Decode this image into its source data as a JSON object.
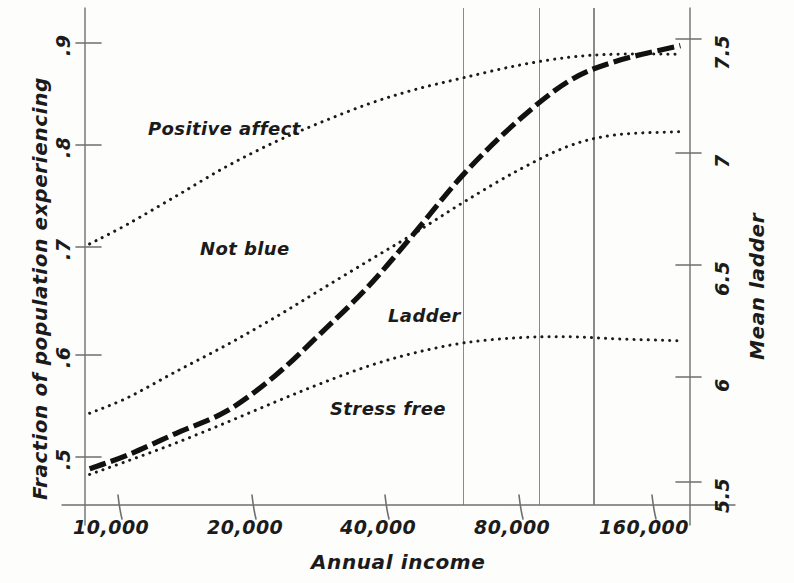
{
  "chart_data": {
    "type": "line",
    "title": "",
    "xlabel": "Annual income",
    "ylabel_left": "Fraction of population experiencing",
    "ylabel_right": "Mean ladder",
    "x_scale": "log",
    "x_tick_labels": [
      "10,000",
      "20,000",
      "40,000",
      "80,000",
      "160,000"
    ],
    "x_tick_values": [
      10000,
      20000,
      40000,
      80000,
      160000
    ],
    "xlim": [
      8000,
      200000
    ],
    "y_left_tick_labels": [
      ".9",
      ".8",
      ".7",
      ".6",
      ".5"
    ],
    "y_left_tick_values": [
      0.9,
      0.8,
      0.7,
      0.6,
      0.5
    ],
    "ylim_left": [
      0.455,
      0.942
    ],
    "y_right_tick_labels": [
      "7.5",
      "7",
      "6.5",
      "6",
      "5.5"
    ],
    "y_right_tick_values": [
      7.5,
      7.0,
      6.5,
      6.0,
      5.5
    ],
    "ylim_right": [
      5.39,
      7.66
    ],
    "grid": "vertical gridlines only",
    "gridline_x_values": [
      60000,
      90000,
      120000
    ],
    "legend": "inline labels next to each curve",
    "series": [
      {
        "name": "Positive affect",
        "axis": "left",
        "style": "dotted",
        "label_position": {
          "x": 148,
          "y": 118
        },
        "points": [
          {
            "income": 8200,
            "value": 0.703
          },
          {
            "income": 10000,
            "value": 0.722
          },
          {
            "income": 13000,
            "value": 0.75
          },
          {
            "income": 17000,
            "value": 0.779
          },
          {
            "income": 22000,
            "value": 0.803
          },
          {
            "income": 28000,
            "value": 0.822
          },
          {
            "income": 36000,
            "value": 0.84
          },
          {
            "income": 46000,
            "value": 0.854
          },
          {
            "income": 60000,
            "value": 0.866
          },
          {
            "income": 80000,
            "value": 0.878
          },
          {
            "income": 105000,
            "value": 0.886
          },
          {
            "income": 135000,
            "value": 0.889
          },
          {
            "income": 190000,
            "value": 0.889
          }
        ]
      },
      {
        "name": "Not blue",
        "axis": "left",
        "style": "dotted",
        "label_position": {
          "x": 200,
          "y": 238
        },
        "points": [
          {
            "income": 8200,
            "value": 0.537
          },
          {
            "income": 10000,
            "value": 0.552
          },
          {
            "income": 13000,
            "value": 0.578
          },
          {
            "income": 17000,
            "value": 0.604
          },
          {
            "income": 22000,
            "value": 0.631
          },
          {
            "income": 28000,
            "value": 0.658
          },
          {
            "income": 36000,
            "value": 0.686
          },
          {
            "income": 46000,
            "value": 0.713
          },
          {
            "income": 60000,
            "value": 0.744
          },
          {
            "income": 80000,
            "value": 0.775
          },
          {
            "income": 105000,
            "value": 0.799
          },
          {
            "income": 135000,
            "value": 0.81
          },
          {
            "income": 190000,
            "value": 0.813
          }
        ]
      },
      {
        "name": "Ladder",
        "axis": "right",
        "style": "thick-dashed",
        "label_position": {
          "x": 388,
          "y": 305
        },
        "points": [
          {
            "income": 8200,
            "value": 5.56
          },
          {
            "income": 10000,
            "value": 5.62
          },
          {
            "income": 13000,
            "value": 5.72
          },
          {
            "income": 17000,
            "value": 5.82
          },
          {
            "income": 22000,
            "value": 5.98
          },
          {
            "income": 28000,
            "value": 6.17
          },
          {
            "income": 36000,
            "value": 6.38
          },
          {
            "income": 46000,
            "value": 6.62
          },
          {
            "income": 60000,
            "value": 6.89
          },
          {
            "income": 80000,
            "value": 7.13
          },
          {
            "income": 105000,
            "value": 7.31
          },
          {
            "income": 135000,
            "value": 7.4
          },
          {
            "income": 190000,
            "value": 7.47
          }
        ]
      },
      {
        "name": "Stress free",
        "axis": "left",
        "style": "dotted",
        "label_position": {
          "x": 330,
          "y": 398
        },
        "points": [
          {
            "income": 8200,
            "value": 0.477
          },
          {
            "income": 10000,
            "value": 0.49
          },
          {
            "income": 13000,
            "value": 0.508
          },
          {
            "income": 17000,
            "value": 0.528
          },
          {
            "income": 22000,
            "value": 0.548
          },
          {
            "income": 28000,
            "value": 0.566
          },
          {
            "income": 36000,
            "value": 0.583
          },
          {
            "income": 46000,
            "value": 0.596
          },
          {
            "income": 60000,
            "value": 0.606
          },
          {
            "income": 80000,
            "value": 0.611
          },
          {
            "income": 105000,
            "value": 0.612
          },
          {
            "income": 135000,
            "value": 0.61
          },
          {
            "income": 190000,
            "value": 0.608
          }
        ]
      }
    ],
    "colors": {
      "axis": "#6f6f6f",
      "gridline": "#8a8a8a",
      "series_dotted": "#1b1b1b",
      "series_ladder": "#111111",
      "text": "#1b1b1b",
      "background": "#fdfdfc"
    }
  },
  "axes": {
    "x_title": "Annual income",
    "y_left_title": "Fraction of population experiencing",
    "y_right_title": "Mean ladder"
  },
  "labels": {
    "positive_affect": "Positive affect",
    "not_blue": "Not blue",
    "ladder": "Ladder",
    "stress_free": "Stress free"
  },
  "x_ticks": {
    "t1": "10,000",
    "t2": "20,000",
    "t3": "40,000",
    "t4": "80,000",
    "t5": "160,000"
  },
  "y_left_ticks": {
    "t1": ".9",
    "t2": ".8",
    "t3": ".7",
    "t4": ".6",
    "t5": ".5"
  },
  "y_right_ticks": {
    "t1": "7.5",
    "t2": "7",
    "t3": "6.5",
    "t4": "6",
    "t5": "5.5"
  }
}
